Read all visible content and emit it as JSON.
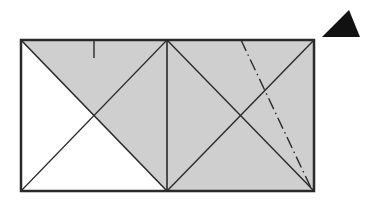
{
  "diagram": {
    "colors": {
      "stroke": "#2a2a2a",
      "shade": "#cfcfcf",
      "background": "#ffffff",
      "marker": "#111111"
    },
    "outer_rect": {
      "x1": 21,
      "y1": 40,
      "x2": 314,
      "y2": 191
    },
    "divider_x": 167,
    "tick": {
      "x": 94,
      "y1": 40,
      "y2": 58
    },
    "fold_line": {
      "x1": 241,
      "y1": 40,
      "x2": 312,
      "y2": 190,
      "style": "dash-dot"
    },
    "triangle_marker": {
      "points": "349,10 322,37 360,37"
    }
  }
}
